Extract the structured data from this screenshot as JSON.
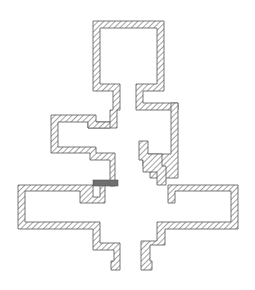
{
  "diagram": {
    "title": "",
    "colors": {
      "background": "#ffffff",
      "outline": "#555555",
      "hatch": "#555555",
      "feed": "#6e6e6e"
    },
    "walls": [
      {
        "name": "top-chamber",
        "points": "93,21 164,21 164,91 143,91 143,103 178,103 178,110 136,110 136,84 157,84 157,28 100,28 100,84 120,84 120,110 117,110 117,128 88,128 88,122 110,122 110,110 113,110 113,91 93,91"
      },
      {
        "name": "left-upper-arm",
        "points": "51,115 96,115 96,122 110,122 110,128 88,128 88,122 58,122 58,147 96,147 96,153 115,153 115,186 110,186 110,160 90,160 90,153 51,153"
      },
      {
        "name": "left-lower-arm",
        "points": "18,185 93,185 93,197 100,197 100,185 105,185 105,203 80,203 80,191 25,191 25,222 100,222 100,243 120,243 120,270 111,270 111,261 114,261 114,250 93,250 93,229 18,229"
      },
      {
        "name": "right-upper-arm",
        "points": "171,103 178,103 178,178 150,178 150,166 143,166 143,154 171,154"
      },
      {
        "name": "right-mid",
        "points": "139,141 148,141 148,154 162,154 162,166 166,166 166,185 157,185 157,172 143,172 143,160 139,160"
      },
      {
        "name": "right-lower-arm",
        "points": "168,185 238,185 238,229 165,229 165,245 150,245 150,261 152,261 152,270 141,270 141,241 157,241 157,222 231,222 231,191 175,191 175,203 168,203"
      }
    ],
    "feed_bar": {
      "x": 93,
      "y": 180,
      "width": 25,
      "height": 6
    }
  }
}
